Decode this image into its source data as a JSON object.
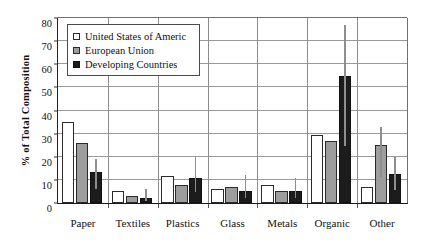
{
  "chart_data": {
    "type": "bar",
    "title": "",
    "xlabel": "",
    "ylabel": "% of Total Composition",
    "ylim": [
      0,
      80
    ],
    "yticks": [
      0,
      10,
      20,
      30,
      40,
      50,
      60,
      70,
      80
    ],
    "grid": true,
    "legend_position": "top-left-inside",
    "categories": [
      "Paper",
      "Textiles",
      "Plastics",
      "Glass",
      "Metals",
      "Organic",
      "Other"
    ],
    "series": [
      {
        "name": "United States of Americ",
        "color": "#ffffff",
        "values": [
          35,
          5,
          11.5,
          6,
          8,
          29.5,
          7
        ],
        "errors_high": [
          null,
          null,
          null,
          null,
          null,
          null,
          null
        ]
      },
      {
        "name": "European Union",
        "color": "#9d9d9d",
        "values": [
          26,
          3,
          8,
          7,
          5,
          27,
          25
        ],
        "errors_high": [
          null,
          null,
          null,
          null,
          null,
          null,
          33
        ]
      },
      {
        "name": "Developing Countries",
        "color": "#1c1c1c",
        "values": [
          13.5,
          2,
          11,
          5,
          5,
          55,
          12.5
        ],
        "errors_high": [
          19,
          6,
          20,
          12,
          11,
          77,
          20
        ]
      }
    ]
  },
  "axis": {
    "y_title": "% of Total Composition",
    "y_tick_labels": [
      "0",
      "10",
      "20",
      "30",
      "40",
      "50",
      "60",
      "70",
      "80"
    ],
    "x_tick_labels": [
      "Paper",
      "Textiles",
      "Plastics",
      "Glass",
      "Metals",
      "Organic",
      "Other"
    ]
  },
  "legend": {
    "items": [
      {
        "label": "United States of Americ",
        "swatch": "usa"
      },
      {
        "label": "European Union",
        "swatch": "eu"
      },
      {
        "label": "Developing Countries",
        "swatch": "dev"
      }
    ]
  }
}
